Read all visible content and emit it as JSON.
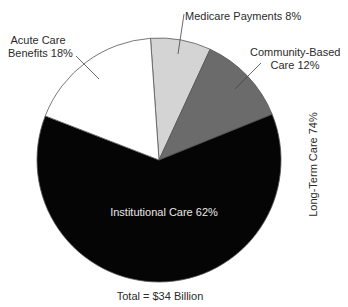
{
  "chart_data": {
    "type": "pie",
    "title": "",
    "total_label": "Total = $34 Billion",
    "total_value_billion": 34,
    "start_angle_deg": -4,
    "direction": "clockwise",
    "slices": [
      {
        "name": "Medicare Payments",
        "label": "Medicare Payments 8%",
        "value": 8,
        "color": "#d4d4d4"
      },
      {
        "name": "Community-Based Care",
        "label": "Community-Based Care 12%",
        "label_line1": "Community-Based",
        "label_line2": "Care 12%",
        "value": 12,
        "color": "#6b6b6b"
      },
      {
        "name": "Institutional Care",
        "label": "Institutional Care 62%",
        "value": 62,
        "color": "#050505"
      },
      {
        "name": "Acute Care Benefits",
        "label": "Acute Care Benefits 18%",
        "label_line1": "Acute Care",
        "label_line2": "Benefits 18%",
        "value": 18,
        "color": "#ffffff"
      }
    ],
    "group_annotations": [
      {
        "label": "Long-Term Care 74%",
        "value": 74,
        "members": [
          "Community-Based Care",
          "Institutional Care"
        ],
        "orientation": "vertical"
      }
    ],
    "outline_color": "#555555"
  },
  "labels": {
    "acute_line1": "Acute Care",
    "acute_line2": "Benefits 18%",
    "medicare": "Medicare Payments 8%",
    "community_line1": "Community-Based",
    "community_line2": "Care 12%",
    "institutional": "Institutional Care 62%",
    "longterm": "Long-Term Care 74%",
    "total": "Total = $34 Billion"
  }
}
